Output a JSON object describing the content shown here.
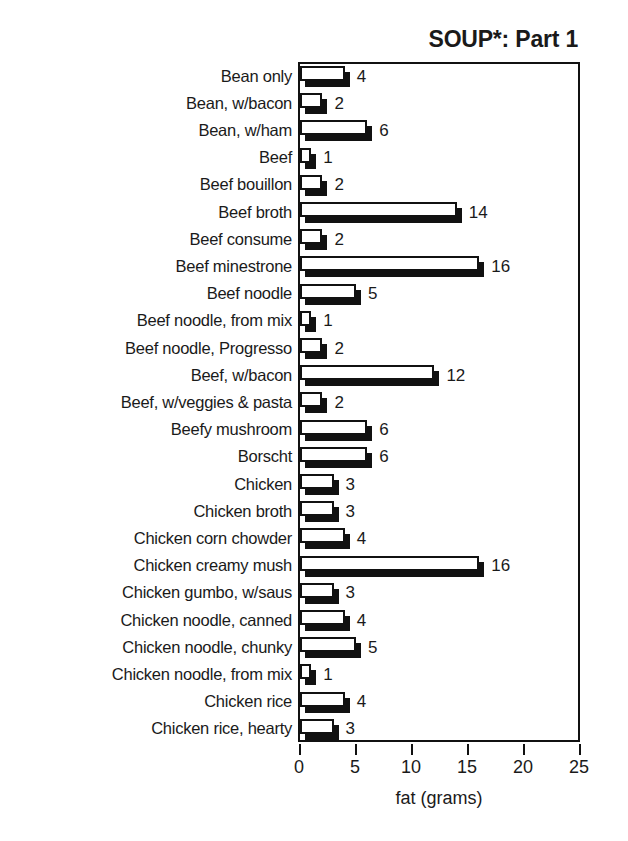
{
  "chart_data": {
    "type": "bar",
    "orientation": "horizontal",
    "title": "SOUP*: Part 1",
    "xlabel": "fat (grams)",
    "ylabel": "",
    "xlim": [
      0,
      25
    ],
    "xticks": [
      0,
      5,
      10,
      15,
      20,
      25
    ],
    "xtick_labels": [
      "0",
      "5",
      "10",
      "15",
      "20",
      "25"
    ],
    "grid": false,
    "legend": false,
    "value_labels": true,
    "categories": [
      "Bean only",
      "Bean, w/bacon",
      "Bean, w/ham",
      "Beef",
      "Beef bouillon",
      "Beef broth",
      "Beef consume",
      "Beef minestrone",
      "Beef noodle",
      "Beef noodle, from mix",
      "Beef noodle, Progresso",
      "Beef, w/bacon",
      "Beef, w/veggies & pasta",
      "Beefy mushroom",
      "Borscht",
      "Chicken",
      "Chicken broth",
      "Chicken corn chowder",
      "Chicken creamy mush",
      "Chicken gumbo, w/saus",
      "Chicken noodle, canned",
      "Chicken noodle, chunky",
      "Chicken noodle, from mix",
      "Chicken rice",
      "Chicken rice, hearty"
    ],
    "values": [
      4,
      2,
      6,
      1,
      2,
      14,
      2,
      16,
      5,
      1,
      2,
      12,
      2,
      6,
      6,
      3,
      3,
      4,
      16,
      3,
      4,
      5,
      1,
      4,
      3
    ],
    "value_text": [
      "4",
      "2",
      "6",
      "1",
      "2",
      "14",
      "2",
      "16",
      "5",
      "1",
      "2",
      "12",
      "2",
      "6",
      "6",
      "3",
      "3",
      "4",
      "16",
      "3",
      "4",
      "5",
      "1",
      "4",
      "3"
    ]
  },
  "colors": {
    "bar_face": "#ffffff",
    "bar_outline": "#111111",
    "bar_shadow": "#111111",
    "text": "#1a1a1a",
    "background": "#ffffff",
    "axis": "#111111"
  }
}
